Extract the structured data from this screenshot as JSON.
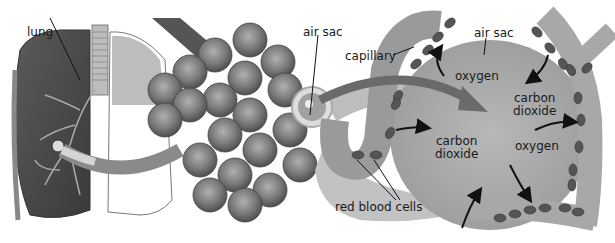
{
  "diagram": {
    "labels": {
      "lung": "lung",
      "air_sac_left": "air sac",
      "capillary": "capillary",
      "air_sac_right": "air sac",
      "oxygen_top": "oxygen",
      "carbon_dioxide_center": "carbon dioxide",
      "carbon_dioxide_center_line1": "carbon",
      "carbon_dioxide_center_line2": "dioxide",
      "carbon_dioxide_right_line1": "carbon",
      "carbon_dioxide_right_line2": "dioxide",
      "oxygen_right": "oxygen",
      "red_blood_cells": "red blood cells"
    },
    "colors": {
      "background": "#ffffff",
      "tissue_dark": "#4a4a4a",
      "tissue_mid": "#8a8a8a",
      "tissue_light": "#c4c4c4",
      "air_sac_fill": "#a8a8a8",
      "capillary_fill": "#b4b4b4",
      "blood_cell": "#555555",
      "text": "#1a1a1a"
    }
  }
}
